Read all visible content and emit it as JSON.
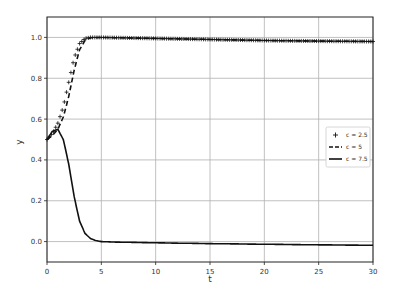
{
  "chart_data": {
    "type": "line",
    "title": "",
    "xlabel": "t",
    "ylabel": "y",
    "xlim": [
      0,
      30
    ],
    "ylim": [
      -0.1,
      1.1
    ],
    "grid": true,
    "legend_position": "center right",
    "x_ticks": [
      "0",
      "5",
      "10",
      "15",
      "20",
      "25",
      "30"
    ],
    "y_ticks": [
      "0.0",
      "0.2",
      "0.4",
      "0.6",
      "0.8",
      "1.0"
    ],
    "series": [
      {
        "name": "c = 2.5",
        "style": "plus-markers",
        "x": [
          0,
          0.5,
          1,
          1.5,
          2,
          2.5,
          3,
          3.5,
          4,
          5,
          10,
          15,
          20,
          25,
          30
        ],
        "values": [
          0.5,
          0.53,
          0.58,
          0.66,
          0.78,
          0.9,
          0.97,
          0.995,
          1.0,
          1.0,
          0.995,
          0.99,
          0.985,
          0.982,
          0.98
        ]
      },
      {
        "name": "c = 5",
        "style": "dashed",
        "x": [
          0,
          0.5,
          1,
          1.5,
          2,
          2.5,
          3,
          3.5,
          4,
          5,
          10,
          15,
          20,
          25,
          30
        ],
        "values": [
          0.5,
          0.52,
          0.55,
          0.61,
          0.71,
          0.84,
          0.94,
          0.985,
          0.998,
          1.0,
          0.995,
          0.99,
          0.985,
          0.982,
          0.98
        ]
      },
      {
        "name": "c = 7.5",
        "style": "solid",
        "x": [
          0,
          0.5,
          1,
          1.5,
          2,
          2.5,
          3,
          3.5,
          4,
          4.5,
          5,
          6,
          10,
          15,
          20,
          25,
          30
        ],
        "values": [
          0.5,
          0.54,
          0.55,
          0.5,
          0.38,
          0.22,
          0.1,
          0.04,
          0.015,
          0.005,
          0.0,
          -0.002,
          -0.006,
          -0.01,
          -0.013,
          -0.016,
          -0.018
        ]
      }
    ]
  }
}
